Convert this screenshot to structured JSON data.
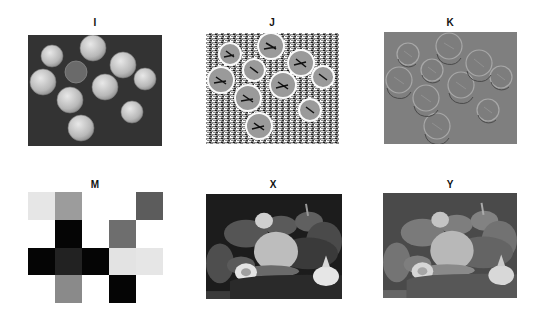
{
  "figure": {
    "panels": [
      {
        "id": "I",
        "title": "I",
        "description": "grayscale photo of coins on dark background",
        "background": "#333333"
      },
      {
        "id": "J",
        "title": "J",
        "description": "high-contrast edge/emboss filtered coins with noisy texture",
        "background": "#8a8a8a"
      },
      {
        "id": "K",
        "title": "K",
        "description": "embossed coins on mid-gray background",
        "background": "#7f7f7f"
      },
      {
        "id": "M",
        "title": "M",
        "description": "5x4 grayscale block matrix"
      },
      {
        "id": "X",
        "title": "X",
        "description": "grayscale photo of peppers and garlic, high contrast",
        "background": "#1e1e1e"
      },
      {
        "id": "Y",
        "title": "Y",
        "description": "grayscale photo of peppers and garlic, reduced contrast",
        "background": "#4a4a4a"
      }
    ],
    "matrix_M": {
      "rows": 4,
      "cols": 5,
      "cells": [
        [
          "#e6e6e6",
          "#9c9c9c",
          "#ffffff",
          "#ffffff",
          "#5c5c5c"
        ],
        [
          "#ffffff",
          "#050505",
          "#ffffff",
          "#6e6e6e",
          "#ffffff"
        ],
        [
          "#050505",
          "#222222",
          "#050505",
          "#e3e3e3",
          "#e6e6e6"
        ],
        [
          "#ffffff",
          "#8a8a8a",
          "#ffffff",
          "#050505",
          "#ffffff"
        ]
      ]
    }
  }
}
